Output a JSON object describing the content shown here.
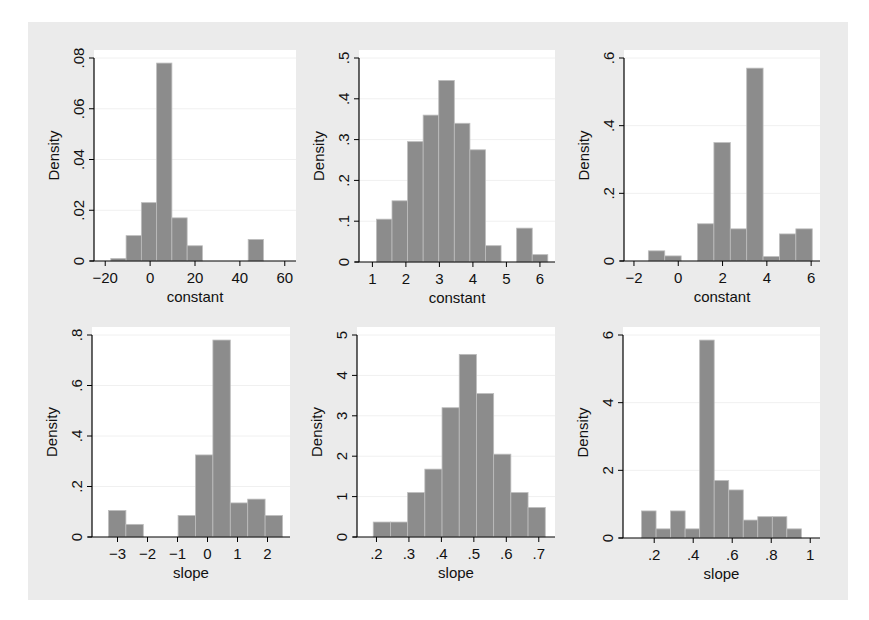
{
  "chart_data": [
    {
      "type": "bar",
      "panel": "top-left",
      "title": "",
      "xlabel": "constant",
      "ylabel": "Density",
      "xlim": [
        -25,
        65
      ],
      "ylim": [
        0,
        0.08
      ],
      "xticks": [
        -20,
        0,
        20,
        40,
        60
      ],
      "xtick_labels": [
        "−20",
        "0",
        "20",
        "40",
        "60"
      ],
      "yticks": [
        0,
        0.02,
        0.04,
        0.06,
        0.08
      ],
      "ytick_labels": [
        "0",
        ".02",
        ".04",
        ".06",
        ".08"
      ],
      "bin_start": -17.5,
      "bin_width": 6.8,
      "values": [
        0.001,
        0.01,
        0.023,
        0.078,
        0.017,
        0.006,
        0,
        0,
        0,
        0.0085
      ],
      "grid": true
    },
    {
      "type": "bar",
      "panel": "top-middle",
      "title": "",
      "xlabel": "constant",
      "ylabel": "Density",
      "xlim": [
        0.6,
        6.45
      ],
      "ylim": [
        0,
        0.5
      ],
      "xticks": [
        1,
        2,
        3,
        4,
        5,
        6
      ],
      "xtick_labels": [
        "1",
        "2",
        "3",
        "4",
        "5",
        "6"
      ],
      "yticks": [
        0,
        0.1,
        0.2,
        0.3,
        0.4,
        0.5
      ],
      "ytick_labels": [
        "0",
        ".1",
        ".2",
        ".3",
        ".4",
        ".5"
      ],
      "bin_start": 1.12,
      "bin_width": 0.465,
      "values": [
        0.105,
        0.15,
        0.295,
        0.36,
        0.445,
        0.34,
        0.275,
        0.04,
        0,
        0.083,
        0.018
      ],
      "grid": true
    },
    {
      "type": "bar",
      "panel": "top-right",
      "title": "",
      "xlabel": "constant",
      "ylabel": "Density",
      "xlim": [
        -2.45,
        6.4
      ],
      "ylim": [
        0,
        0.6
      ],
      "xticks": [
        -2,
        0,
        2,
        4,
        6
      ],
      "xtick_labels": [
        "−2",
        "0",
        "2",
        "4",
        "6"
      ],
      "yticks": [
        0,
        0.2,
        0.4,
        0.6
      ],
      "ytick_labels": [
        "0",
        ".2",
        ".4",
        ".6"
      ],
      "bin_start": -1.35,
      "bin_width": 0.74,
      "values": [
        0.03,
        0.015,
        0,
        0.11,
        0.35,
        0.095,
        0.57,
        0.013,
        0.08,
        0.095
      ],
      "grid": true
    },
    {
      "type": "bar",
      "panel": "bottom-left",
      "title": "",
      "xlabel": "slope",
      "ylabel": "Density",
      "xlim": [
        -3.85,
        2.75
      ],
      "ylim": [
        0,
        0.8
      ],
      "xticks": [
        -3,
        -2,
        -1,
        0,
        1,
        2
      ],
      "xtick_labels": [
        "−3",
        "−2",
        "−1",
        "0",
        "1",
        "2"
      ],
      "yticks": [
        0,
        0.2,
        0.4,
        0.6,
        0.8
      ],
      "ytick_labels": [
        "0",
        ".2",
        ".4",
        ".6",
        ".8"
      ],
      "bin_start": -3.3,
      "bin_width": 0.58,
      "values": [
        0.105,
        0.05,
        0,
        0,
        0.085,
        0.325,
        0.78,
        0.135,
        0.15,
        0.085
      ],
      "grid": true
    },
    {
      "type": "bar",
      "panel": "bottom-middle",
      "title": "",
      "xlabel": "slope",
      "ylabel": "Density",
      "xlim": [
        0.14,
        0.75
      ],
      "ylim": [
        0,
        5
      ],
      "xticks": [
        0.2,
        0.3,
        0.4,
        0.5,
        0.6,
        0.7
      ],
      "xtick_labels": [
        ".2",
        ".3",
        ".4",
        ".5",
        ".6",
        ".7"
      ],
      "yticks": [
        0,
        1,
        2,
        3,
        4,
        5
      ],
      "ytick_labels": [
        "0",
        "1",
        "2",
        "3",
        "4",
        "5"
      ],
      "bin_start": 0.19,
      "bin_width": 0.053,
      "values": [
        0.37,
        0.37,
        1.1,
        1.68,
        3.2,
        4.52,
        3.55,
        2.05,
        1.1,
        0.73
      ],
      "grid": true
    },
    {
      "type": "bar",
      "panel": "bottom-right",
      "title": "",
      "xlabel": "slope",
      "ylabel": "Density",
      "xlim": [
        0.04,
        1.05
      ],
      "ylim": [
        0,
        6
      ],
      "xticks": [
        0.2,
        0.4,
        0.6,
        0.8,
        1
      ],
      "xtick_labels": [
        ".2",
        ".4",
        ".6",
        ".8",
        "1"
      ],
      "yticks": [
        0,
        2,
        4,
        6
      ],
      "ytick_labels": [
        "0",
        "2",
        "4",
        "6"
      ],
      "bin_start": 0.135,
      "bin_width": 0.0745,
      "values": [
        0.8,
        0.27,
        0.8,
        0.27,
        5.85,
        1.7,
        1.42,
        0.53,
        0.63,
        0.63,
        0.27
      ],
      "grid": true
    }
  ],
  "layout": {
    "panels": [
      {
        "plot_left": 94,
        "plot_right": 296,
        "plot_top": 50,
        "plot_bottom": 261
      },
      {
        "plot_left": 359,
        "plot_right": 555,
        "plot_top": 50,
        "plot_bottom": 262
      },
      {
        "plot_left": 624,
        "plot_right": 820,
        "plot_top": 50,
        "plot_bottom": 261
      },
      {
        "plot_left": 92,
        "plot_right": 290,
        "plot_top": 327,
        "plot_bottom": 537
      },
      {
        "plot_left": 357,
        "plot_right": 555,
        "plot_top": 327,
        "plot_bottom": 537
      },
      {
        "plot_left": 623,
        "plot_right": 820,
        "plot_top": 327,
        "plot_bottom": 538
      }
    ],
    "colors": {
      "bar_fill": "#8c8c8c",
      "bar_edge": "#bdbdbd",
      "graph_background": "#ebebeb",
      "plot_background": "#ffffff"
    }
  }
}
